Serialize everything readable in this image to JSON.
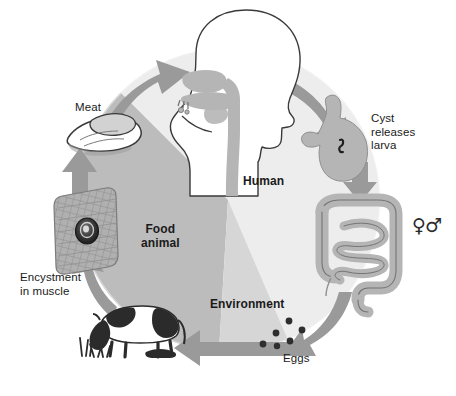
{
  "diagram": {
    "type": "cycle-diagram",
    "background_color": "#ffffff"
  },
  "sectors": [
    {
      "id": "human",
      "label": "Human",
      "color": "#ededed",
      "text_color": "#1a1a1a"
    },
    {
      "id": "food_animal",
      "label": "Food\nanimal",
      "color": "#bcbcbc",
      "text_color": "#1a1a1a"
    },
    {
      "id": "environment",
      "label": "Environment",
      "color": "#d6d6d6",
      "text_color": "#1a1a1a"
    }
  ],
  "labels": {
    "meat": "Meat",
    "cyst_releases_larva": "Cyst\nreleases\nlarva",
    "encystment_in_muscle": "Encystment\nin muscle",
    "eggs": "Eggs",
    "sex_symbols": "♀♂"
  },
  "illustrations": [
    {
      "id": "head",
      "name": "human-head-mouth-pharynx",
      "description": "Profile of human head with shaded nasal, oral and pharyngeal passage"
    },
    {
      "id": "stomach",
      "name": "stomach-with-larva",
      "description": "Stomach silhouette containing a dark larva"
    },
    {
      "id": "intestine",
      "name": "intestines",
      "description": "Large intestine framing coiled small intestine"
    },
    {
      "id": "eggs",
      "name": "egg-dots",
      "description": "Six dark egg dots scattered in the environment sector"
    },
    {
      "id": "cow",
      "name": "grazing-cow",
      "description": "Black and white Holstein cow grazing on grass"
    },
    {
      "id": "muscle",
      "name": "muscle-tissue-with-cyst",
      "description": "Cross-hatched muscle block containing an encysted larva"
    },
    {
      "id": "meat",
      "name": "cut-of-meat",
      "description": "Sliced cut of raw meat"
    }
  ],
  "arrows": [
    {
      "id": "arrow-meat-to-mouth",
      "from": "meat",
      "to": "mouth",
      "direction": "clockwise"
    },
    {
      "id": "arrow-mouth-to-stomach",
      "from": "mouth",
      "to": "stomach",
      "direction": "clockwise"
    },
    {
      "id": "arrow-stomach-to-intestine",
      "from": "stomach",
      "to": "intestine",
      "direction": "clockwise"
    },
    {
      "id": "arrow-intestine-to-eggs",
      "from": "intestine",
      "to": "eggs",
      "direction": "clockwise"
    },
    {
      "id": "arrow-eggs-to-cow",
      "from": "eggs",
      "to": "cow",
      "direction": "clockwise"
    },
    {
      "id": "arrow-cow-to-muscle",
      "from": "cow",
      "to": "muscle",
      "direction": "clockwise"
    },
    {
      "id": "arrow-muscle-to-meat",
      "from": "muscle",
      "to": "meat",
      "direction": "clockwise"
    }
  ],
  "colors": {
    "arrow": "#9a9a9a",
    "arrow_dark": "#8c8c8c",
    "organ_fill": "#b5b5b5",
    "organ_stroke": "#6e6e6e",
    "outline": "#3a3a3a",
    "egg": "#2e2e2e",
    "cow_dark": "#2b2b2b"
  }
}
